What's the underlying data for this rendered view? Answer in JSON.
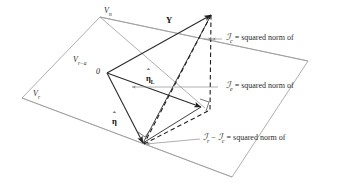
{
  "figure": {
    "colors": {
      "plane_stroke": "#9a9a9a",
      "vector_stroke": "#2b2b2b",
      "dashed_stroke": "#1f1f1f",
      "leader_stroke": "#8c8c8c",
      "text": "#1a1a1a"
    }
  },
  "planes": {
    "outer_label": "V",
    "outer_sub": "n",
    "inner_label": "V",
    "inner_sub": "r−a",
    "lower_label": "V",
    "lower_sub": "r"
  },
  "vectors": {
    "y": {
      "label": "Y"
    },
    "eta_hat_L": {
      "label": "η",
      "sub": "L",
      "hat": "ˆ"
    },
    "eta_hat": {
      "label": "η",
      "sub": "",
      "hat": "ˆ"
    },
    "origin": {
      "label": "0"
    }
  },
  "annotations": [
    {
      "name": "sum-of-squares-c",
      "symbol": "ℐ",
      "sub": "c",
      "equation": "= squared norm of"
    },
    {
      "name": "sum-of-squares-e",
      "symbol": "ℐ",
      "sub": "e",
      "equation": "= squared norm of"
    },
    {
      "name": "sum-of-squares-difference",
      "symbol_a": "ℐ",
      "sub_a": "r",
      "minus": "−",
      "symbol_b": "ℐ",
      "sub_b": "c",
      "equation": "= squared norm of"
    }
  ]
}
